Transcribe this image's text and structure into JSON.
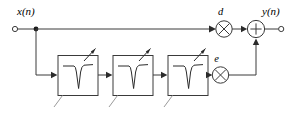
{
  "diagram": {
    "type": "signal-flow-block-diagram",
    "background_color": "#ffffff",
    "line_color": "#3a3a3a",
    "labels": {
      "input": "x(n)",
      "output": "y(n)",
      "direct_gain": "d",
      "error_gain": "e"
    },
    "terminals": [
      {
        "name": "input-terminal",
        "label": "x(n)",
        "shape": "open-circle"
      },
      {
        "name": "output-terminal",
        "label": "y(n)",
        "shape": "open-circle"
      }
    ],
    "blocks": [
      {
        "name": "notch-filter-1",
        "glyph": "notch-response",
        "adaptive": true
      },
      {
        "name": "notch-filter-2",
        "glyph": "notch-response",
        "adaptive": true
      },
      {
        "name": "notch-filter-3",
        "glyph": "notch-response",
        "adaptive": true
      }
    ],
    "operators": [
      {
        "name": "multiplier-d",
        "symbol": "×",
        "label": "d"
      },
      {
        "name": "multiplier-e",
        "symbol": "×",
        "label": "e"
      },
      {
        "name": "adder",
        "symbol": "+",
        "label": ""
      }
    ],
    "paths": [
      {
        "name": "direct-path",
        "from": "x(n)",
        "through": "d",
        "to": "adder"
      },
      {
        "name": "filter-path",
        "from": "x(n)",
        "through": "notch cascade, e",
        "to": "adder"
      }
    ],
    "icons": {
      "notch": "notch-response-icon",
      "adaptive_arrow": "adaptive-tuning-arrow-icon",
      "multiply": "multiply-icon",
      "sum": "sum-icon",
      "signal_arrow": "signal-arrow-icon"
    }
  }
}
